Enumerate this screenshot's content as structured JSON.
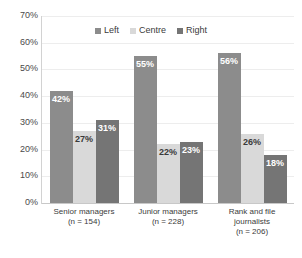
{
  "chart_data": {
    "type": "bar",
    "title": "",
    "xlabel": "",
    "ylabel": "",
    "ylim": [
      0,
      70
    ],
    "grid": true,
    "legend_position": "top-center",
    "categories": [
      "Senior managers\n(n = 154)",
      "Junior managers\n(n = 228)",
      "Rank and file journalists\n(n = 206)"
    ],
    "category_lines": [
      [
        "Senior managers",
        "(n = 154)"
      ],
      [
        "Junior managers",
        "(n = 228)"
      ],
      [
        "Rank and file",
        "journalists",
        "(n = 206)"
      ]
    ],
    "series": [
      {
        "name": "Left",
        "values": [
          42,
          55,
          56
        ],
        "labels": [
          "42%",
          "55%",
          "56%"
        ],
        "color": "#8c8c8c",
        "label_color": "#ffffff"
      },
      {
        "name": "Centre",
        "values": [
          27,
          22,
          26
        ],
        "labels": [
          "27%",
          "22%",
          "26%"
        ],
        "color": "#d9d9d9",
        "label_color": "#3a3a3a"
      },
      {
        "name": "Right",
        "values": [
          31,
          23,
          18
        ],
        "labels": [
          "31%",
          "23%",
          "18%"
        ],
        "color": "#757575",
        "label_color": "#ffffff"
      }
    ],
    "ytick_labels": [
      "70%",
      "60%",
      "50%",
      "40%",
      "30%",
      "20%",
      "10%",
      "0%"
    ],
    "ytick_values": [
      70,
      60,
      50,
      40,
      30,
      20,
      10,
      0
    ]
  },
  "colors": {
    "background": "#ffffff",
    "gridline": "#ededed",
    "axis": "#c8c8c8",
    "tick_text": "#4a4a4a",
    "category_text": "#3b3b3b",
    "legend_text": "#3b3b3b"
  }
}
